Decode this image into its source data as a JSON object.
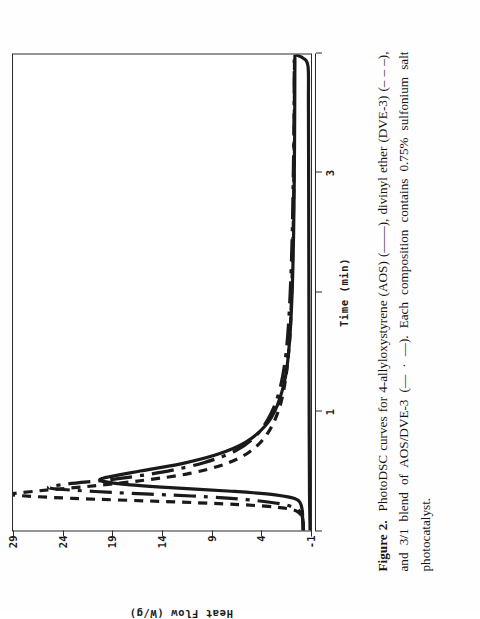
{
  "figure": {
    "number_label": "Figure 2.",
    "caption_text": "PhotoDSC curves for 4-allyloxystyrene (AOS) (——), divinyl ether (DVE-3) (– – –), and 3/1 blend of AOS/DVE-3 (— · —). Each composition contains 0.75% sulfonium salt photocatalyst.",
    "page_rotation_degrees": -90
  },
  "chart_data": {
    "type": "line",
    "title": "",
    "xlabel": "Time (min)",
    "ylabel": "Heat Flow (W/g)",
    "xlim": [
      0,
      4
    ],
    "ylim": [
      -1,
      29
    ],
    "xticks": [
      0,
      1,
      2,
      3,
      4
    ],
    "xtick_labels": [
      "",
      "1",
      "",
      "3",
      ""
    ],
    "yticks": [
      -1,
      4,
      9,
      14,
      19,
      24,
      29
    ],
    "ytick_labels": [
      "-1",
      "4",
      "9",
      "14",
      "19",
      "24",
      "29"
    ],
    "grid": false,
    "legend_position": "none",
    "series": [
      {
        "name": "4-allyloxystyrene (AOS)",
        "style": "solid",
        "color": "#1a1a1a",
        "peak_value": 20.2,
        "peak_time": 0.42,
        "x": [
          0.0,
          0.05,
          0.1,
          0.18,
          0.26,
          0.3,
          0.33,
          0.36,
          0.39,
          0.42,
          0.45,
          0.5,
          0.56,
          0.64,
          0.74,
          0.88,
          1.05,
          1.3,
          1.6,
          2.0,
          2.5,
          3.0,
          3.5,
          4.0
        ],
        "y": [
          -0.2,
          -0.2,
          -0.15,
          -0.1,
          0.4,
          2.6,
          7.0,
          13.2,
          18.0,
          20.2,
          19.4,
          16.2,
          12.1,
          8.4,
          5.6,
          3.6,
          2.4,
          1.55,
          1.15,
          0.9,
          0.75,
          0.68,
          0.64,
          0.62
        ]
      },
      {
        "name": "divinyl ether (DVE-3)",
        "style": "dashed",
        "color": "#1a1a1a",
        "peak_value": 29.0,
        "peak_time": 0.3,
        "x": [
          0.0,
          0.04,
          0.09,
          0.14,
          0.18,
          0.21,
          0.24,
          0.27,
          0.3,
          0.33,
          0.37,
          0.42,
          0.48,
          0.56,
          0.66,
          0.8,
          1.0,
          1.25,
          1.6,
          2.0,
          2.5,
          3.0,
          3.5,
          4.0
        ],
        "y": [
          -0.25,
          -0.22,
          -0.18,
          0.1,
          1.1,
          4.6,
          12.5,
          23.0,
          29.0,
          26.8,
          21.5,
          16.0,
          11.2,
          7.6,
          5.2,
          3.5,
          2.3,
          1.6,
          1.15,
          0.95,
          0.8,
          0.72,
          0.68,
          0.66
        ]
      },
      {
        "name": "3/1 blend of AOS/DVE-3",
        "style": "dash-dot",
        "color": "#1a1a1a",
        "peak_value": 25.2,
        "peak_time": 0.355,
        "x": [
          0.0,
          0.05,
          0.11,
          0.17,
          0.22,
          0.26,
          0.29,
          0.32,
          0.355,
          0.39,
          0.43,
          0.49,
          0.57,
          0.67,
          0.8,
          0.98,
          1.2,
          1.5,
          1.9,
          2.4,
          2.9,
          3.4,
          4.0
        ],
        "y": [
          -0.22,
          -0.2,
          -0.14,
          0.25,
          1.8,
          5.6,
          11.0,
          19.0,
          25.2,
          23.6,
          19.0,
          14.0,
          9.8,
          6.6,
          4.5,
          3.05,
          2.1,
          1.5,
          1.15,
          0.92,
          0.8,
          0.72,
          0.68
        ]
      },
      {
        "name": "lower baseline trace",
        "style": "solid",
        "color": "#1a1a1a",
        "peak_value": 0.0,
        "peak_time": 0.0,
        "x": [
          0.0,
          0.02,
          0.05,
          0.3,
          0.8,
          1.5,
          2.2,
          3.0,
          3.6,
          3.9,
          3.97,
          4.0
        ],
        "y": [
          -0.9,
          -0.9,
          -0.9,
          -0.85,
          -0.82,
          -0.8,
          -0.78,
          -0.76,
          -0.74,
          -0.7,
          -0.2,
          0.6
        ]
      }
    ]
  }
}
